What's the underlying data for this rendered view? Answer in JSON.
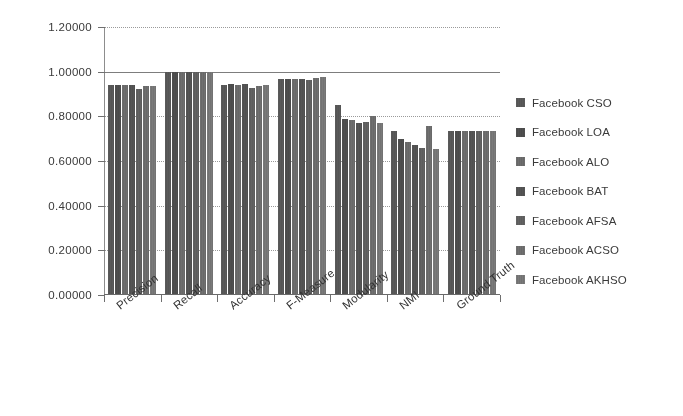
{
  "chart_data": {
    "type": "bar",
    "title": "",
    "xlabel": "",
    "ylabel": "",
    "ylim": [
      0.0,
      1.2
    ],
    "ytick_step": 0.2,
    "ytick_labels": [
      "0.00000",
      "0.20000",
      "0.40000",
      "0.60000",
      "0.80000",
      "1.00000",
      "1.20000"
    ],
    "ytick_values": [
      0.0,
      0.2,
      0.4,
      0.6,
      0.8,
      1.0,
      1.2
    ],
    "grid": true,
    "legend_position": "right",
    "categories": [
      "Precision",
      "Recall",
      "Accuracy",
      "F-Measure",
      "Modularity",
      "NMI",
      "Ground Truth"
    ],
    "series": [
      {
        "name": "Facebook CSO",
        "color": "#5a5a5a",
        "values": [
          0.94,
          1.0,
          0.942,
          0.965,
          0.85,
          0.735,
          0.735
        ]
      },
      {
        "name": "Facebook LOA",
        "color": "#4f4f4f",
        "values": [
          0.942,
          1.0,
          0.944,
          0.968,
          0.79,
          0.7,
          0.735
        ]
      },
      {
        "name": "Facebook ALO",
        "color": "#6e6e6e",
        "values": [
          0.94,
          1.0,
          0.941,
          0.966,
          0.783,
          0.686,
          0.735
        ]
      },
      {
        "name": "Facebook BAT",
        "color": "#555555",
        "values": [
          0.941,
          1.0,
          0.943,
          0.968,
          0.772,
          0.672,
          0.735
        ]
      },
      {
        "name": "Facebook AFSA",
        "color": "#636363",
        "values": [
          0.922,
          1.0,
          0.925,
          0.962,
          0.775,
          0.66,
          0.735
        ]
      },
      {
        "name": "Facebook ACSO",
        "color": "#707070",
        "values": [
          0.936,
          1.0,
          0.938,
          0.972,
          0.8,
          0.755,
          0.735
        ]
      },
      {
        "name": "Facebook AKHSO",
        "color": "#7a7a7a",
        "values": [
          0.938,
          1.0,
          0.94,
          0.975,
          0.768,
          0.655,
          0.735
        ]
      }
    ]
  },
  "legend": {
    "items": [
      {
        "label": "Facebook CSO"
      },
      {
        "label": "Facebook LOA"
      },
      {
        "label": "Facebook ALO"
      },
      {
        "label": "Facebook BAT"
      },
      {
        "label": "Facebook AFSA"
      },
      {
        "label": "Facebook ACSO"
      },
      {
        "label": "Facebook AKHSO"
      }
    ]
  }
}
